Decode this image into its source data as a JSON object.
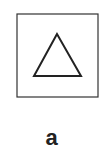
{
  "figure": {
    "label": "a",
    "frame": {
      "x": 17,
      "y": 14,
      "width": 81,
      "height": 83,
      "stroke": "#333333"
    },
    "triangle": {
      "points": "57,34 34,76 81,76",
      "stroke": "#222222"
    }
  }
}
